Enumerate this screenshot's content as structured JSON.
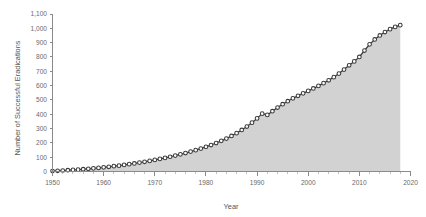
{
  "chart_data": {
    "type": "area",
    "title": "",
    "xlabel": "Year",
    "ylabel": "Number of Successful Eradications",
    "xlim": [
      1950,
      2020
    ],
    "ylim": [
      0,
      1100
    ],
    "grid": false,
    "legend": false,
    "x_ticks": [
      1950,
      1960,
      1970,
      1980,
      1990,
      2000,
      2010,
      2020
    ],
    "x_tick_labels": [
      "1950",
      "1960",
      "1970",
      "1980",
      "1990",
      "2000",
      "2010",
      "2020"
    ],
    "x_minor_tick_step": 2,
    "y_ticks": [
      0,
      100,
      200,
      300,
      400,
      500,
      600,
      700,
      800,
      900,
      1000,
      1100
    ],
    "y_tick_labels": [
      "0",
      "100",
      "200",
      "300",
      "400",
      "500",
      "600",
      "700",
      "800",
      "900",
      "1,000",
      "1,100"
    ],
    "marker": "open-circle",
    "line_color": "#3a3a3a",
    "fill_color": "#d2d2d2",
    "series": [
      {
        "name": "Cumulative successful eradications",
        "x": [
          1950,
          1951,
          1952,
          1953,
          1954,
          1955,
          1956,
          1957,
          1958,
          1959,
          1960,
          1961,
          1962,
          1963,
          1964,
          1965,
          1966,
          1967,
          1968,
          1969,
          1970,
          1971,
          1972,
          1973,
          1974,
          1975,
          1976,
          1977,
          1978,
          1979,
          1980,
          1981,
          1982,
          1983,
          1984,
          1985,
          1986,
          1987,
          1988,
          1989,
          1990,
          1991,
          1992,
          1993,
          1994,
          1995,
          1996,
          1997,
          1998,
          1999,
          2000,
          2001,
          2002,
          2003,
          2004,
          2005,
          2006,
          2007,
          2008,
          2009,
          2010,
          2011,
          2012,
          2013,
          2014,
          2015,
          2016,
          2017,
          2018
        ],
        "values": [
          3,
          5,
          7,
          9,
          11,
          13,
          16,
          19,
          22,
          25,
          29,
          33,
          37,
          41,
          46,
          51,
          56,
          62,
          68,
          74,
          81,
          88,
          95,
          103,
          111,
          120,
          129,
          139,
          149,
          160,
          172,
          185,
          199,
          214,
          230,
          248,
          268,
          290,
          314,
          341,
          371,
          404,
          395,
          421,
          447,
          470,
          491,
          511,
          529,
          546,
          563,
          580,
          598,
          617,
          637,
          659,
          684,
          712,
          742,
          769,
          800,
          845,
          888,
          922,
          950,
          974,
          994,
          1010,
          1022
        ]
      }
    ]
  }
}
